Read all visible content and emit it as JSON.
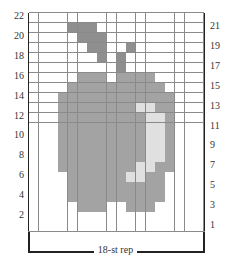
{
  "chart": {
    "columns": 18,
    "rows": 22,
    "repeat_label": "18-st rep",
    "left_row_numbers": [
      "22",
      "20",
      "18",
      "16",
      "14",
      "12",
      "10",
      "8",
      "6",
      "4",
      "2"
    ],
    "right_row_numbers": [
      "21",
      "19",
      "17",
      "15",
      "13",
      "11",
      "9",
      "7",
      "5",
      "3",
      "1"
    ],
    "colors": {
      "background": "#ffffff",
      "stem": "#8f8f8f",
      "body": "#a3a3a3",
      "highlight": "#e0e0e0",
      "gridline": "#8a8a8a"
    },
    "pattern_rows": {
      "22": {
        "stem": [],
        "body": [],
        "highlight": []
      },
      "21": {
        "stem": [
          5,
          6,
          7
        ],
        "body": [],
        "highlight": []
      },
      "20": {
        "stem": [
          6,
          7,
          8
        ],
        "body": [],
        "highlight": []
      },
      "19": {
        "stem": [
          7,
          8,
          11
        ],
        "body": [],
        "highlight": []
      },
      "18": {
        "stem": [
          8,
          10
        ],
        "body": [],
        "highlight": []
      },
      "17": {
        "stem": [
          10
        ],
        "body": [],
        "highlight": []
      },
      "16": {
        "stem": [],
        "body": [
          6,
          7,
          8,
          10,
          11,
          12,
          13
        ],
        "highlight": []
      },
      "15": {
        "stem": [],
        "body": [
          5,
          6,
          7,
          8,
          9,
          10,
          11,
          12,
          13,
          14
        ],
        "highlight": []
      },
      "14": {
        "stem": [],
        "body": [
          4,
          5,
          6,
          7,
          8,
          9,
          10,
          11,
          12,
          13,
          14,
          15
        ],
        "highlight": []
      },
      "13": {
        "stem": [],
        "body": [
          4,
          5,
          6,
          7,
          8,
          9,
          10,
          11,
          14,
          15
        ],
        "highlight": [
          12,
          13
        ]
      },
      "12": {
        "stem": [],
        "body": [
          4,
          5,
          6,
          7,
          8,
          9,
          10,
          11,
          12,
          15
        ],
        "highlight": [
          13,
          14
        ]
      },
      "11": {
        "stem": [],
        "body": [
          4,
          5,
          6,
          7,
          8,
          9,
          10,
          11,
          12,
          15
        ],
        "highlight": [
          13,
          14
        ]
      },
      "10": {
        "stem": [],
        "body": [
          4,
          5,
          6,
          7,
          8,
          9,
          10,
          11,
          12,
          15
        ],
        "highlight": [
          13,
          14
        ]
      },
      "9": {
        "stem": [],
        "body": [
          4,
          5,
          6,
          7,
          8,
          9,
          10,
          11,
          12,
          15
        ],
        "highlight": [
          13,
          14
        ]
      },
      "8": {
        "stem": [],
        "body": [
          4,
          5,
          6,
          7,
          8,
          9,
          10,
          11,
          12,
          15
        ],
        "highlight": [
          13,
          14
        ]
      },
      "7": {
        "stem": [],
        "body": [
          4,
          5,
          6,
          7,
          8,
          9,
          10,
          11,
          14,
          15
        ],
        "highlight": [
          12,
          13
        ]
      },
      "6": {
        "stem": [],
        "body": [
          5,
          6,
          7,
          8,
          9,
          10,
          13,
          14
        ],
        "highlight": [
          11,
          12
        ]
      },
      "5": {
        "stem": [],
        "body": [
          5,
          6,
          7,
          8,
          9,
          10,
          11,
          12,
          13,
          14
        ],
        "highlight": []
      },
      "4": {
        "stem": [],
        "body": [
          5,
          6,
          7,
          8,
          9,
          10,
          11,
          12,
          13,
          14
        ],
        "highlight": []
      },
      "3": {
        "stem": [],
        "body": [
          6,
          7,
          8,
          11,
          12,
          13
        ],
        "highlight": []
      },
      "2": {
        "stem": [],
        "body": [],
        "highlight": []
      },
      "1": {
        "stem": [],
        "body": [],
        "highlight": []
      }
    }
  }
}
